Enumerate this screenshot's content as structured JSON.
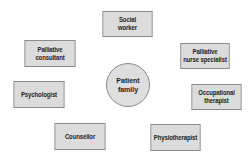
{
  "diagram": {
    "type": "hub-and-spoke",
    "center": {
      "lines": [
        "Patient",
        "family"
      ],
      "shape": "circle"
    },
    "nodes": [
      {
        "id": "social-worker",
        "lines": [
          "Social",
          "worker"
        ]
      },
      {
        "id": "palliative-consultant",
        "lines": [
          "Palliative",
          "consultant"
        ]
      },
      {
        "id": "palliative-nurse-specialist",
        "lines": [
          "Palliative",
          "nurse specialist"
        ]
      },
      {
        "id": "psychologist",
        "lines": [
          "Psychologist"
        ]
      },
      {
        "id": "occupational-therapist",
        "lines": [
          "Occupational",
          "therapist"
        ]
      },
      {
        "id": "counsellor",
        "lines": [
          "Counsellor"
        ]
      },
      {
        "id": "physiotherapist",
        "lines": [
          "Physiotherapist"
        ]
      }
    ],
    "colors": {
      "box_fill": "#dcdcdc",
      "box_border": "#8a8a8a",
      "text": "#222222",
      "background": "#ffffff"
    }
  }
}
